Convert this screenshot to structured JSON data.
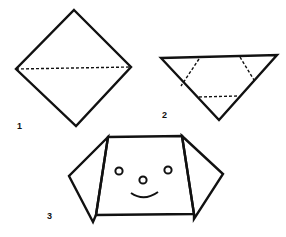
{
  "colors": {
    "ink": "#111111",
    "paper": "#ffffff"
  },
  "steps": [
    {
      "label": "1",
      "description": "Square placed as diamond, fold along dashed horizontal diagonal",
      "label_pos": [
        17,
        129
      ],
      "outline": "74,10 131,67 76,126 16,69",
      "folds": [
        {
          "x1": 16,
          "y1": 69,
          "x2": 131,
          "y2": 67
        }
      ]
    },
    {
      "label": "2",
      "description": "Triangle with three dashed fold lines for ears and chin",
      "label_pos": [
        162,
        118
      ],
      "outline": "161,58 277,55 219,120",
      "folds": [
        {
          "x1": 199,
          "y1": 59,
          "x2": 181,
          "y2": 86
        },
        {
          "x1": 240,
          "y1": 57,
          "x2": 254,
          "y2": 80
        },
        {
          "x1": 199,
          "y1": 97,
          "x2": 238,
          "y2": 96
        }
      ]
    },
    {
      "label": "3",
      "description": "Finished dog face with folded ears, eyes, nose and smile",
      "label_pos": [
        47,
        219
      ],
      "face": "108,137 182,136 194,214 96,215",
      "left_ear": "108,137 69,176 93,222 96,215",
      "right_ear": "182,136 223,174 194,219 194,214",
      "eyes": [
        {
          "cx": 119,
          "cy": 171,
          "r": 3.6
        },
        {
          "cx": 168,
          "cy": 170,
          "r": 3.6
        }
      ],
      "nose": {
        "cx": 143,
        "cy": 180,
        "r": 3.6
      },
      "mouth": "M131,193 Q144,202 158,192"
    }
  ]
}
